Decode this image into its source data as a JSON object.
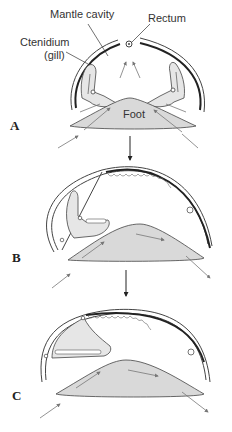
{
  "labels": {
    "mantle_cavity": "Mantle cavity",
    "rectum": "Rectum",
    "ctenidium_line1": "Ctenidium",
    "ctenidium_line2": "(gill)",
    "foot": "Foot"
  },
  "panels": [
    {
      "id": "A",
      "letter": "A"
    },
    {
      "id": "B",
      "letter": "B"
    },
    {
      "id": "C",
      "letter": "C"
    }
  ],
  "colors": {
    "foot_fill": "#d9d9d9",
    "gill_fill": "#e6e6e6",
    "stroke": "#444444",
    "shell_dark": "#222222",
    "flow_arrow": "#777777"
  }
}
